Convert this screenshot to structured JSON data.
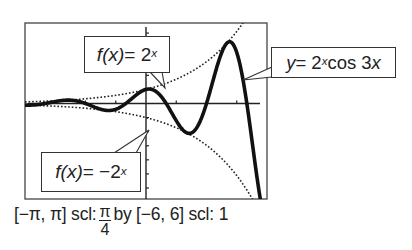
{
  "chart_data": {
    "type": "line",
    "title": "",
    "xlabel": "",
    "ylabel": "",
    "xlim": [
      -3.14159,
      3.14159
    ],
    "ylim": [
      -6,
      6
    ],
    "x_scale": 0.785398,
    "y_scale": 1,
    "grid": false,
    "series": [
      {
        "name": "f(x) = 2^x",
        "expression": "2^x",
        "style": "dotted",
        "color": "#222222"
      },
      {
        "name": "f(x) = -2^x",
        "expression": "-2^x",
        "style": "dotted",
        "color": "#222222"
      },
      {
        "name": "y = 2^x cos 3x",
        "expression": "2^x*cos(3x)",
        "style": "thick",
        "color": "#111111"
      }
    ],
    "annotations": [
      {
        "text": "f(x) = 2^x",
        "points_to": [
          0.6,
          1.5
        ]
      },
      {
        "text": "y = 2^x cos 3x",
        "points_to": [
          2.4,
          1.5
        ]
      },
      {
        "text": "f(x) = -2^x",
        "points_to": [
          0.05,
          -1.05
        ]
      }
    ]
  },
  "callouts": {
    "upper": {
      "lhs": "f(x)",
      "eq": " = 2",
      "exp": "x"
    },
    "right": {
      "lhs": "y",
      "eq": " = 2",
      "exp": "x",
      "rest": "cos 3",
      "var": "x"
    },
    "lower": {
      "lhs": "f(x)",
      "eq": " = −2",
      "exp": "x"
    }
  },
  "caption": {
    "xrange": "[−π, π] scl:",
    "xscl_num": "π",
    "xscl_den": "4",
    "yrange": "by [−6, 6] scl: 1"
  }
}
